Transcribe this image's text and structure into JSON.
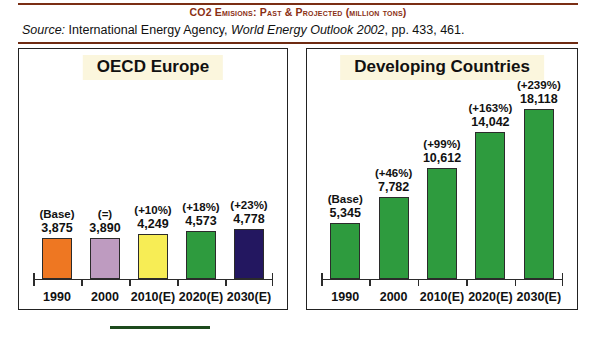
{
  "header": {
    "title": "CO2 Emisions: Past & Projected (million tons)",
    "source_label": "Source:",
    "source_text_1": "International Energy Agency,",
    "source_italic": "World Energy Outlook 2002",
    "source_text_2": ", pp. 433, 461."
  },
  "colors": {
    "title_brown": "#8a2f14",
    "rule_brown": "#7a2e14",
    "panel_title_bg": "#fbf6dd",
    "green_rule": "#1c4a1c"
  },
  "chart_data": [
    {
      "type": "bar",
      "title": "OECD Europe",
      "xlabel": "",
      "ylabel": "",
      "ylim": [
        0,
        19000
      ],
      "grid": false,
      "legend": "none",
      "categories": [
        "1990",
        "2000",
        "2010(E)",
        "2020(E)",
        "2030(E)"
      ],
      "values": [
        3875,
        3890,
        4249,
        4573,
        4778
      ],
      "value_labels": [
        "3,875",
        "3,890",
        "4,249",
        "4,573",
        "4,778"
      ],
      "pct_labels": [
        "(Base)",
        "(=)",
        "(+10%)",
        "(+18%)",
        "(+23%)"
      ],
      "bar_colors": [
        "#EE7722",
        "#BE9BC0",
        "#F7ED55",
        "#2E9B3E",
        "#231760"
      ]
    },
    {
      "type": "bar",
      "title": "Developing Countries",
      "xlabel": "",
      "ylabel": "",
      "ylim": [
        0,
        19000
      ],
      "grid": false,
      "legend": "none",
      "categories": [
        "1990",
        "2000",
        "2010(E)",
        "2020(E)",
        "2030(E)"
      ],
      "values": [
        5345,
        7782,
        10612,
        14042,
        18118
      ],
      "value_labels": [
        "5,345",
        "7,782",
        "10,612",
        "14,042",
        "18,118"
      ],
      "pct_labels": [
        "(Base)",
        "(+46%)",
        "(+99%)",
        "(+163%)",
        "(+239%)"
      ],
      "bar_colors": [
        "#2E9B3E",
        "#2E9B3E",
        "#2E9B3E",
        "#2E9B3E",
        "#2E9B3E"
      ]
    }
  ]
}
